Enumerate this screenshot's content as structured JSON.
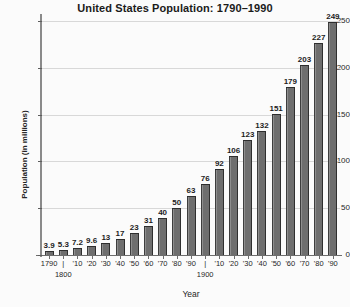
{
  "chart_data": {
    "type": "bar",
    "title": "United States Population: 1790–1990",
    "xlabel": "Year",
    "ylabel": "Population (in millions)",
    "ylim": [
      0,
      250
    ],
    "yticks": [
      0,
      50,
      100,
      150,
      200,
      250
    ],
    "ytick_labels": [
      "0",
      "50",
      "100",
      "150",
      "200",
      "250"
    ],
    "grid": true,
    "legend": "none",
    "categories": [
      "1790",
      "1800",
      "1810",
      "1820",
      "1830",
      "1840",
      "1850",
      "1860",
      "1870",
      "1880",
      "1890",
      "1900",
      "1910",
      "1920",
      "1930",
      "1940",
      "1950",
      "1960",
      "1970",
      "1980",
      "1990"
    ],
    "xtick_labels": [
      "1790",
      "|",
      "'10",
      "'20",
      "'30",
      "'40",
      "'50",
      "'60",
      "'70",
      "'80",
      "'90",
      "|",
      "'10",
      "'20",
      "'30",
      "'40",
      "'50",
      "'60",
      "'70",
      "'80",
      "'90"
    ],
    "xtick_sublabels": [
      "",
      "1800",
      "",
      "",
      "",
      "",
      "",
      "",
      "",
      "",
      "",
      "1900",
      "",
      "",
      "",
      "",
      "",
      "",
      "",
      "",
      ""
    ],
    "values": [
      3.9,
      5.3,
      7.2,
      9.6,
      13,
      17,
      23,
      31,
      40,
      50,
      63,
      76,
      92,
      106,
      123,
      132,
      151,
      179,
      203,
      227,
      249
    ],
    "value_labels": [
      "3.9",
      "5.3",
      "7.2",
      "9.6",
      "13",
      "17",
      "23",
      "31",
      "40",
      "50",
      "63",
      "76",
      "92",
      "106",
      "123",
      "132",
      "151",
      "179",
      "203",
      "227",
      "249"
    ],
    "bar_color": "#6e6e6e",
    "grid_color": "#d8d8d8",
    "axis_color": "#6d6d6d",
    "text_color": "#1d1d1d",
    "background_color": "#fbfbfb"
  }
}
